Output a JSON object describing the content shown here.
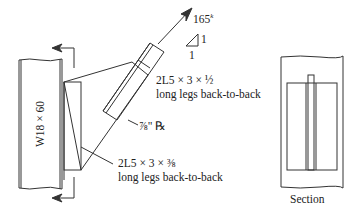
{
  "figure": {
    "column_label": "W18 × 60",
    "force": {
      "value": "165",
      "unit_superscript": "k"
    },
    "slope": {
      "rise": "1",
      "run": "1"
    },
    "brace_label": {
      "line1": "2L5 × 3 × ½",
      "line2": "long legs back-to-back"
    },
    "gusset_label": "⅞\" ℞",
    "beam_angle_label": {
      "line1": "2L5 × 3 × ⅜",
      "line2": "long legs back-to-back"
    },
    "section_label": "Section"
  },
  "colors": {
    "line": "#333333",
    "background": "#ffffff"
  }
}
